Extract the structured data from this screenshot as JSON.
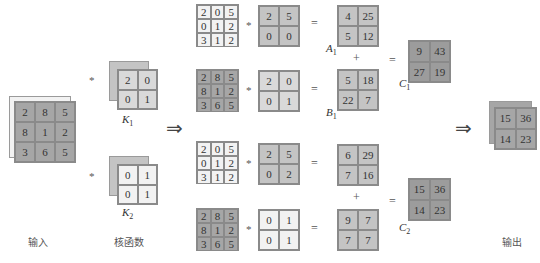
{
  "captions": {
    "input": "输入",
    "kernel": "核函数",
    "output": "输出"
  },
  "operators": {
    "conv": "*",
    "eq": "=",
    "plus": "+",
    "implies": "⇒"
  },
  "labels": {
    "K1": {
      "main": "K",
      "sub": "1"
    },
    "K2": {
      "main": "K",
      "sub": "2"
    },
    "A1": {
      "main": "A",
      "sub": "1"
    },
    "B1": {
      "main": "B",
      "sub": "1"
    },
    "C1": {
      "main": "C",
      "sub": "1"
    },
    "C2": {
      "main": "C",
      "sub": "2"
    }
  },
  "input": {
    "channel_front": [
      [
        "2",
        "8",
        "5"
      ],
      [
        "8",
        "1",
        "2"
      ],
      [
        "3",
        "6",
        "5"
      ]
    ],
    "channel_back": [
      [
        "2",
        "0",
        "5"
      ],
      [
        "0",
        "1",
        "2"
      ],
      [
        "3",
        "1",
        "2"
      ]
    ]
  },
  "kernels": {
    "K1": {
      "front": [
        [
          "2",
          "0"
        ],
        [
          "0",
          "1"
        ]
      ],
      "back": [
        [
          "2",
          "5"
        ],
        [
          "0",
          "0"
        ]
      ]
    },
    "K2": {
      "front": [
        [
          "0",
          "1"
        ],
        [
          "0",
          "1"
        ]
      ],
      "back": [
        [
          "2",
          "5"
        ],
        [
          "0",
          "2"
        ]
      ]
    }
  },
  "rows": [
    {
      "input": [
        [
          "2",
          "0",
          "5"
        ],
        [
          "0",
          "1",
          "2"
        ],
        [
          "3",
          "1",
          "2"
        ]
      ],
      "kernel": [
        [
          "2",
          "5"
        ],
        [
          "0",
          "0"
        ]
      ],
      "result": [
        [
          "4",
          "25"
        ],
        [
          "5",
          "12"
        ]
      ],
      "label": "A1"
    },
    {
      "input": [
        [
          "2",
          "8",
          "5"
        ],
        [
          "8",
          "1",
          "2"
        ],
        [
          "3",
          "6",
          "5"
        ]
      ],
      "kernel": [
        [
          "2",
          "0"
        ],
        [
          "0",
          "1"
        ]
      ],
      "result": [
        [
          "5",
          "18"
        ],
        [
          "22",
          "7"
        ]
      ],
      "label": "B1"
    },
    {
      "input": [
        [
          "2",
          "0",
          "5"
        ],
        [
          "0",
          "1",
          "2"
        ],
        [
          "3",
          "1",
          "2"
        ]
      ],
      "kernel": [
        [
          "2",
          "5"
        ],
        [
          "0",
          "2"
        ]
      ],
      "result": [
        [
          "6",
          "29"
        ],
        [
          "7",
          "16"
        ]
      ]
    },
    {
      "input": [
        [
          "2",
          "8",
          "5"
        ],
        [
          "8",
          "1",
          "2"
        ],
        [
          "3",
          "6",
          "5"
        ]
      ],
      "kernel": [
        [
          "0",
          "1"
        ],
        [
          "0",
          "1"
        ]
      ],
      "result": [
        [
          "9",
          "7"
        ],
        [
          "7",
          "7"
        ]
      ]
    }
  ],
  "sums": {
    "C1": [
      [
        "9",
        "43"
      ],
      [
        "27",
        "19"
      ]
    ],
    "C2": [
      [
        "15",
        "36"
      ],
      [
        "14",
        "23"
      ]
    ]
  },
  "output": {
    "front": [
      [
        "15",
        "36"
      ],
      [
        "14",
        "23"
      ]
    ]
  },
  "colors": {
    "white_cell": "#f2f2f2",
    "light_cell": "#d9d9d9",
    "mid_cell": "#c4c4c4",
    "dark_cell": "#a6a6a6",
    "grid_line": "#8a8a8a"
  }
}
